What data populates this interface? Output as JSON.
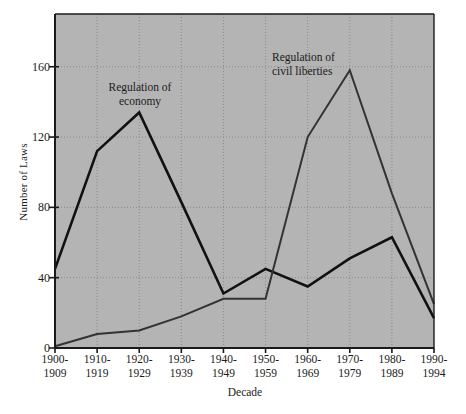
{
  "chart_data": {
    "type": "line",
    "title": "",
    "xlabel": "Decade",
    "ylabel": "Number of Laws",
    "categories": [
      "1900-1909",
      "1910-1919",
      "1920-1929",
      "1930-1939",
      "1940-1949",
      "1950-1959",
      "1960-1969",
      "1970-1979",
      "1980-1989",
      "1990-1994"
    ],
    "category_lines": [
      [
        "1900-",
        "1909"
      ],
      [
        "1910-",
        "1919"
      ],
      [
        "1920-",
        "1929"
      ],
      [
        "1930-",
        "1939"
      ],
      [
        "1940-",
        "1949"
      ],
      [
        "1950-",
        "1959"
      ],
      [
        "1960-",
        "1969"
      ],
      [
        "1970-",
        "1979"
      ],
      [
        "1980-",
        "1989"
      ],
      [
        "1990-",
        "1994"
      ]
    ],
    "series": [
      {
        "name": "Regulation of economy",
        "label_lines": [
          "Regulation of",
          "economy"
        ],
        "values": [
          45,
          112,
          134,
          83,
          31,
          45,
          35,
          51,
          63,
          17
        ],
        "color": "#111111",
        "line_width": 2.6
      },
      {
        "name": "Regulation of civil liberties",
        "label_lines": [
          "Regulation of",
          "civil liberties"
        ],
        "values": [
          1,
          8,
          10,
          18,
          28,
          28,
          120,
          158,
          88,
          25
        ],
        "color": "#333333",
        "line_width": 2.0
      }
    ],
    "ylim": [
      0,
      190
    ],
    "yticks": [
      0,
      40,
      80,
      120,
      160
    ],
    "ytick_labels": [
      "0",
      "40",
      "80",
      "120",
      "160"
    ],
    "grid": true,
    "grid_style": "dotted",
    "legend": "none",
    "plot_background": "#b4b4b4",
    "figure_background": "#ffffff",
    "axis_color": "#1a1a1a",
    "grid_color": "#8a8a8a"
  }
}
